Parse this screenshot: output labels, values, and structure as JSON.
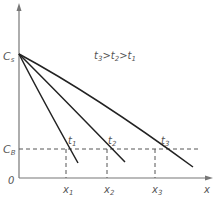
{
  "diagram": {
    "y_axis_labels": {
      "cs": "C",
      "cs_sub": "s",
      "cb": "C",
      "cb_sub": "B",
      "origin": "0"
    },
    "x_axis_label": "x",
    "relation": {
      "t3": "t",
      "t3_sub": "3",
      "gt1": ">",
      "t2": "t",
      "t2_sub": "2",
      "gt2": ">",
      "t1": "t",
      "t1_sub": "1"
    },
    "curves": [
      {
        "label": "t",
        "sub": "1"
      },
      {
        "label": "t",
        "sub": "2"
      },
      {
        "label": "t",
        "sub": "3"
      }
    ],
    "x_marks": [
      {
        "label": "x",
        "sub": "1"
      },
      {
        "label": "x",
        "sub": "2"
      },
      {
        "label": "x",
        "sub": "3"
      }
    ],
    "colors": {
      "axis": "#777777",
      "curve": "#222222",
      "dash": "#555555",
      "text": "#555555"
    }
  }
}
